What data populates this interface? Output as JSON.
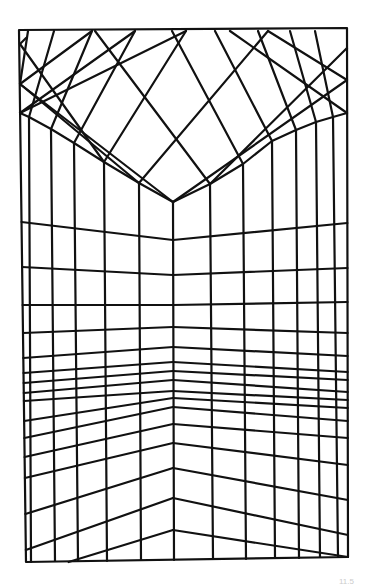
{
  "figure": {
    "stroke_color": "#111111",
    "background": "#ffffff",
    "frame": {
      "points": [
        [
          19,
          30
        ],
        [
          347,
          28
        ],
        [
          348,
          557
        ],
        [
          26,
          562
        ]
      ]
    },
    "corner_edge": {
      "x": 173,
      "top": 202,
      "bottom": 560
    },
    "ceiling_edge": {
      "left": [
        [
          20,
          113
        ],
        [
          29,
          117
        ],
        [
          51,
          129
        ],
        [
          74,
          143
        ],
        [
          104,
          162
        ],
        [
          139,
          183
        ],
        [
          173,
          202
        ]
      ],
      "right": [
        [
          173,
          202
        ],
        [
          210,
          184
        ],
        [
          243,
          164
        ],
        [
          272,
          141
        ],
        [
          296,
          130
        ],
        [
          316,
          122
        ],
        [
          333,
          117
        ],
        [
          347,
          113
        ]
      ]
    },
    "left_wall_verticals": [
      {
        "top": [
          29,
          117
        ],
        "bottom": [
          31,
          562
        ]
      },
      {
        "top": [
          51,
          129
        ],
        "bottom": [
          55,
          561
        ]
      },
      {
        "top": [
          74,
          143
        ],
        "bottom": [
          78,
          561
        ]
      },
      {
        "top": [
          104,
          162
        ],
        "bottom": [
          107,
          561
        ]
      },
      {
        "top": [
          139,
          183
        ],
        "bottom": [
          141,
          560
        ]
      }
    ],
    "right_wall_verticals": [
      {
        "top": [
          210,
          184
        ],
        "bottom": [
          213,
          559
        ]
      },
      {
        "top": [
          243,
          164
        ],
        "bottom": [
          246,
          559
        ]
      },
      {
        "top": [
          272,
          141
        ],
        "bottom": [
          275,
          558
        ]
      },
      {
        "top": [
          296,
          130
        ],
        "bottom": [
          299,
          558
        ]
      },
      {
        "top": [
          316,
          122
        ],
        "bottom": [
          320,
          557
        ]
      },
      {
        "top": [
          333,
          117
        ],
        "bottom": [
          338,
          557
        ]
      }
    ],
    "ceiling_lines": [
      [
        [
          29,
          117
        ],
        [
          54,
          31
        ]
      ],
      [
        [
          51,
          129
        ],
        [
          92,
          31
        ]
      ],
      [
        [
          74,
          143
        ],
        [
          135,
          31
        ]
      ],
      [
        [
          104,
          162
        ],
        [
          186,
          31
        ]
      ],
      [
        [
          139,
          183
        ],
        [
          268,
          31
        ]
      ],
      [
        [
          173,
          202
        ],
        [
          347,
          80
        ]
      ],
      [
        [
          210,
          184
        ],
        [
          95,
          31
        ]
      ],
      [
        [
          243,
          164
        ],
        [
          172,
          31
        ]
      ],
      [
        [
          272,
          141
        ],
        [
          215,
          31
        ]
      ],
      [
        [
          296,
          130
        ],
        [
          258,
          31
        ]
      ],
      [
        [
          316,
          122
        ],
        [
          290,
          31
        ]
      ],
      [
        [
          333,
          117
        ],
        [
          315,
          31
        ]
      ],
      [
        [
          139,
          183
        ],
        [
          20,
          84
        ]
      ],
      [
        [
          104,
          162
        ],
        [
          20,
          44
        ]
      ],
      [
        [
          173,
          202
        ],
        [
          20,
          84
        ]
      ],
      [
        [
          210,
          184
        ],
        [
          347,
          48
        ]
      ],
      [
        [
          268,
          31
        ],
        [
          347,
          80
        ]
      ],
      [
        [
          20,
          84
        ],
        [
          28,
          31
        ]
      ],
      [
        [
          20,
          44
        ],
        [
          26,
          38
        ]
      ],
      [
        [
          92,
          31
        ],
        [
          20,
          84
        ]
      ],
      [
        [
          135,
          31
        ],
        [
          20,
          113
        ]
      ],
      [
        [
          186,
          31
        ],
        [
          20,
          113
        ]
      ],
      [
        [
          230,
          31
        ],
        [
          347,
          113
        ]
      ]
    ],
    "left_wall_lines": [
      [
        222,
        240
      ],
      [
        267,
        275
      ],
      [
        305,
        305
      ],
      [
        333,
        327
      ],
      [
        358,
        347
      ],
      [
        373,
        362
      ],
      [
        383,
        371
      ],
      [
        393,
        380
      ],
      [
        401,
        391
      ],
      [
        421,
        398
      ],
      [
        438,
        407
      ],
      [
        457,
        424
      ],
      [
        478,
        443
      ],
      [
        514,
        468
      ],
      [
        550,
        498
      ],
      [
        575,
        530
      ]
    ],
    "right_wall_lines": [
      [
        240,
        223
      ],
      [
        275,
        268
      ],
      [
        305,
        302
      ],
      [
        327,
        333
      ],
      [
        347,
        356
      ],
      [
        362,
        372
      ],
      [
        371,
        380
      ],
      [
        380,
        392
      ],
      [
        391,
        400
      ],
      [
        398,
        408
      ],
      [
        407,
        421
      ],
      [
        424,
        438
      ],
      [
        443,
        465
      ],
      [
        468,
        500
      ],
      [
        498,
        535
      ],
      [
        530,
        557
      ]
    ],
    "caption": "11.5"
  }
}
